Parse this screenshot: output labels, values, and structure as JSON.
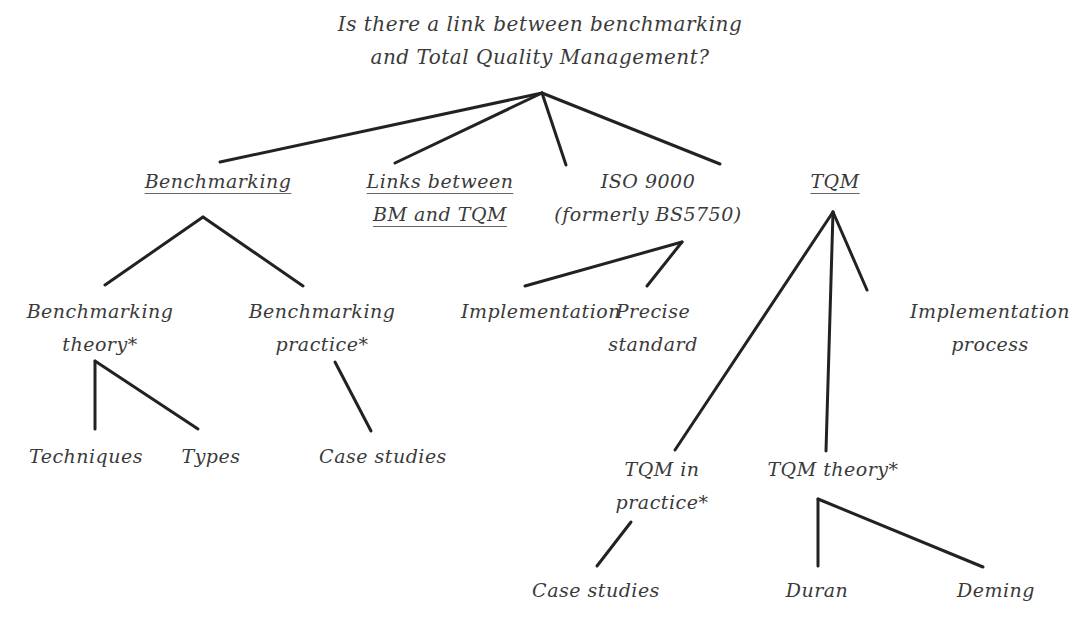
{
  "diagram": {
    "root": {
      "lines": [
        "Is there a link between benchmarking",
        "and Total Quality Management?"
      ]
    },
    "benchmarking": {
      "lines": [
        "Benchmarking"
      ],
      "underlined": true
    },
    "links": {
      "lines": [
        "Links between",
        "BM and TQM"
      ],
      "underlined": true
    },
    "iso": {
      "lines": [
        "ISO 9000",
        "(formerly BS5750)"
      ]
    },
    "tqm": {
      "lines": [
        "TQM"
      ],
      "underlined": true
    },
    "bm_theory": {
      "lines": [
        "Benchmarking",
        "theory*"
      ]
    },
    "bm_practice": {
      "lines": [
        "Benchmarking",
        "practice*"
      ]
    },
    "iso_implementation": {
      "lines": [
        "Implementation"
      ]
    },
    "iso_precise": {
      "lines": [
        "Precise",
        "standard"
      ]
    },
    "tqm_implementation": {
      "lines": [
        "Implementation",
        "process"
      ]
    },
    "techniques": {
      "lines": [
        "Techniques"
      ]
    },
    "types": {
      "lines": [
        "Types"
      ]
    },
    "bm_case_studies": {
      "lines": [
        "Case studies"
      ]
    },
    "tqm_practice": {
      "lines": [
        "TQM in",
        "practice*"
      ]
    },
    "tqm_theory": {
      "lines": [
        "TQM theory*"
      ]
    },
    "tqm_case_studies": {
      "lines": [
        "Case studies"
      ]
    },
    "duran": {
      "lines": [
        "Duran"
      ]
    },
    "deming": {
      "lines": [
        "Deming"
      ]
    },
    "line_color": "#222222",
    "text_color": "#3a3a3a"
  }
}
